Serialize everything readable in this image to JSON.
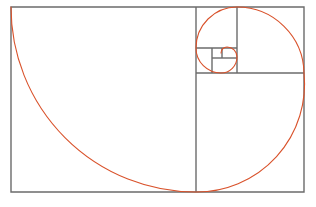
{
  "figure": {
    "name": "fibonacci-golden-spiral",
    "canvas": {
      "width": 316,
      "height": 207
    },
    "colors": {
      "background": "#ffffff",
      "rectangle_stroke": "#6b6b6b",
      "spiral_stroke": "#d9522b"
    },
    "stroke_widths": {
      "rectangle": 1.4,
      "spiral": 1.1
    },
    "outer_rectangle": {
      "x": 11,
      "y": 7,
      "width": 293,
      "height": 185
    },
    "fibonacci_sequence": [
      1,
      1,
      2,
      3,
      5,
      8,
      13,
      21
    ],
    "golden_ratio": 1.618,
    "squares": [
      {
        "index": 1,
        "label": "square-13",
        "size": 185,
        "x": 11,
        "y": 7,
        "arc_corner": "top-left-to-bottom-right",
        "sweep": "bottom-left-center"
      },
      {
        "index": 2,
        "label": "square-8",
        "size": 114,
        "x": 196,
        "y": 7,
        "arc_corner": "bottom-left-to-top-right",
        "sweep": "top-left-center"
      },
      {
        "index": 3,
        "label": "square-5",
        "size": 71,
        "x": 196,
        "y": 121,
        "arc_corner": "top-left-to-bottom-right",
        "sweep": "bottom-right-center"
      },
      {
        "index": 4,
        "label": "square-3",
        "size": 43,
        "x": 261,
        "y": 121,
        "arc_corner": "top-right-to-bottom-left",
        "sweep": "bottom-right-center"
      },
      {
        "index": 5,
        "label": "square-2",
        "size": 27,
        "x": 234,
        "y": 94,
        "arc_corner": "bottom-right-to-top-left",
        "sweep": "top-right-center"
      },
      {
        "index": 6,
        "label": "square-1a",
        "size": 17,
        "x": 217,
        "y": 94,
        "arc_corner": "top-right-to-bottom-left",
        "sweep": "top-left-center"
      },
      {
        "index": 7,
        "label": "square-1b",
        "size": 10,
        "x": 217,
        "y": 111,
        "arc_corner": "bottom-left-to-top-right",
        "sweep": "bottom-left-center"
      }
    ],
    "divider_lines": [
      {
        "name": "divider-vertical-main",
        "x1": 196,
        "y1": 7,
        "x2": 196,
        "y2": 192
      },
      {
        "name": "divider-horizontal-8",
        "x1": 196,
        "y1": 73,
        "x2": 304,
        "y2": 73
      },
      {
        "name": "divider-vertical-5",
        "x1": 237,
        "y1": 7,
        "x2": 237,
        "y2": 73
      },
      {
        "name": "divider-horizontal-3",
        "x1": 196,
        "y1": 48,
        "x2": 237,
        "y2": 48
      },
      {
        "name": "divider-vertical-2",
        "x1": 212,
        "y1": 48,
        "x2": 212,
        "y2": 73
      },
      {
        "name": "divider-horizontal-1",
        "x1": 212,
        "y1": 58,
        "x2": 237,
        "y2": 58
      },
      {
        "name": "divider-vertical-1",
        "x1": 222,
        "y1": 48,
        "x2": 222,
        "y2": 58
      }
    ],
    "spiral_path_description": "Quarter-circle arcs chained through nested Fibonacci squares forming a logarithmic golden spiral",
    "spiral_path": "M 11 7 A 185 185 0 0 0 196 192 A 108 108 0 0 0 304 73 A 67 67 0 0 0 237 7 A 41 41 0 0 0 196 48 A 25 25 0 0 0 221 73 A 16 16 0 0 0 237 57 A 10 10 0 0 0 227 47 A 6 6 0 0 0 221 53",
    "rect_path": "M 11 7 L 304 7 L 304 192 L 11 192 Z"
  }
}
